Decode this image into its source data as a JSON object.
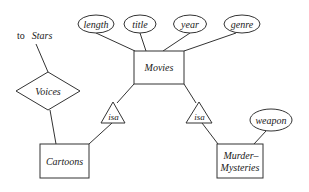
{
  "diagram": {
    "type": "ER diagram",
    "entities": [
      {
        "id": "movies",
        "label": "Movies"
      },
      {
        "id": "cartoons",
        "label": "Cartoons"
      },
      {
        "id": "murder_mysteries",
        "label_line1": "Murder–",
        "label_line2": "Mysteries"
      }
    ],
    "attributes": [
      {
        "id": "length",
        "label": "length",
        "of": "Movies"
      },
      {
        "id": "title",
        "label": "title",
        "of": "Movies"
      },
      {
        "id": "year",
        "label": "year",
        "of": "Movies"
      },
      {
        "id": "genre",
        "label": "genre",
        "of": "Movies"
      },
      {
        "id": "weapon",
        "label": "weapon",
        "of": "Murder-Mysteries"
      }
    ],
    "relationships": [
      {
        "id": "voices",
        "label": "Voices",
        "connects": [
          "Cartoons",
          "Stars"
        ]
      }
    ],
    "isa": [
      {
        "id": "isa_cartoons",
        "label": "isa",
        "parent": "Movies",
        "child": "Cartoons"
      },
      {
        "id": "isa_mysteries",
        "label": "isa",
        "parent": "Movies",
        "child": "Murder-Mysteries"
      }
    ],
    "external_ref": {
      "prefix": "to",
      "target": "Stars"
    }
  }
}
